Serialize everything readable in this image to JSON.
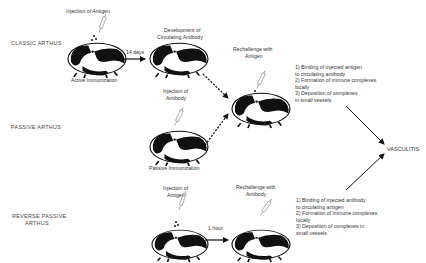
{
  "rows": {
    "classic": "CLASSIC ARTHUS",
    "passive": "PASSIVE ARTHUS",
    "reverse_line1": "REVERSE PASSIVE",
    "reverse_line2": "ARTHUS"
  },
  "classic": {
    "inject_label": "Injection of Antigen",
    "pig1_caption": "Active Immunization",
    "arrow_label": "14 days",
    "dev_line1": "Development of",
    "dev_line2": "Circulating Antibody",
    "rechallenge_line1": "Rechallenge with",
    "rechallenge_line2": "Antigen",
    "steps": [
      "1)  Binding of injected antigen",
      "     to circulating antibody",
      "2)  Formation of immune complexes",
      "     locally",
      "3)  Deposition of complexes",
      "     in small vessels"
    ]
  },
  "passive": {
    "inject_line1": "Injection of",
    "inject_line2": "Antibody",
    "pig_caption": "Passive Immunization"
  },
  "reverse": {
    "inject_line1": "Injection of",
    "inject_line2": "Antigen",
    "arrow_label": "1 hour",
    "rechallenge_line1": "Rechallenge with",
    "rechallenge_line2": "Antibody",
    "steps": [
      "1)  Binding of injected antibody",
      "     to circulating antigen",
      "2)  Formation of immune complexes",
      "     locally",
      "3)  Deposition of complexes in",
      "     small vessels"
    ]
  },
  "outcome": "VASCULITIS",
  "icons": {
    "animal": "guinea-pig-icon",
    "syringe": "syringe-icon"
  }
}
